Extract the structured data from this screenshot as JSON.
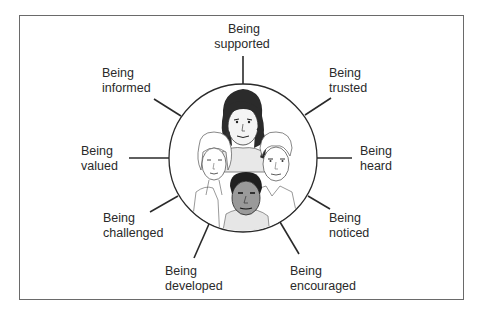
{
  "diagram": {
    "center_description": "Four illustrated faces inside a circle",
    "faces": [
      {
        "position": "top",
        "description": "woman with dark hair"
      },
      {
        "position": "left",
        "description": "woman with light hair"
      },
      {
        "position": "right",
        "description": "man with light hair"
      },
      {
        "position": "bottom",
        "description": "man with dark complexion"
      }
    ],
    "spokes": [
      {
        "id": "supported",
        "line1": "Being",
        "line2": "supported"
      },
      {
        "id": "trusted",
        "line1": "Being",
        "line2": "trusted"
      },
      {
        "id": "heard",
        "line1": "Being",
        "line2": "heard"
      },
      {
        "id": "noticed",
        "line1": "Being",
        "line2": "noticed"
      },
      {
        "id": "encouraged",
        "line1": "Being",
        "line2": "encouraged"
      },
      {
        "id": "developed",
        "line1": "Being",
        "line2": "developed"
      },
      {
        "id": "challenged",
        "line1": "Being",
        "line2": "challenged"
      },
      {
        "id": "valued",
        "line1": "Being",
        "line2": "valued"
      },
      {
        "id": "informed",
        "line1": "Being",
        "line2": "informed"
      }
    ],
    "colors": {
      "line": "#2a2a2a",
      "frame": "#6a6a6a",
      "skin_shade": "#cfcfcf",
      "dark_hair": "#2b2b2b"
    }
  }
}
